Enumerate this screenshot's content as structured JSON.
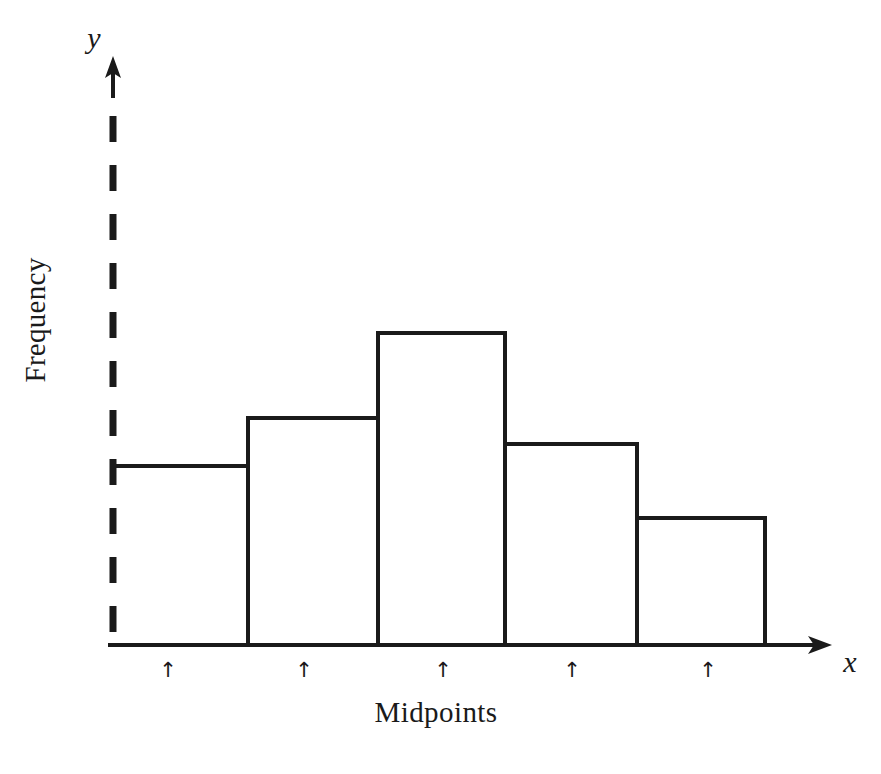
{
  "figure": {
    "background_color": "#ffffff",
    "ink_color": "#1a1a1a",
    "width": 881,
    "height": 774
  },
  "labels": {
    "y_axis_symbol": "y",
    "x_axis_symbol": "x",
    "y_axis_title": "Frequency",
    "x_axis_caption": "Midpoints",
    "tick_marker_glyph": "↑"
  },
  "chart_data": {
    "type": "bar",
    "title": "",
    "subtitle": "",
    "xlabel": "Midpoints",
    "ylabel": "Frequency",
    "grid": false,
    "legend": "none",
    "axis_style": {
      "y_axis_line": "dashed",
      "x_axis_line": "solid",
      "y_axis_arrow": true,
      "x_axis_arrow": true,
      "tick_labels_shown": false,
      "tick_markers": "up-arrow"
    },
    "categories": [
      "Midpoint 1",
      "Midpoint 2",
      "Midpoint 3",
      "Midpoint 4",
      "Midpoint 5"
    ],
    "values": [
      3.2,
      4.3,
      6.3,
      3.8,
      2.3
    ],
    "values_note": "relative bar heights read from baseline in pixels: 179, 227, 312, 201, 127",
    "ylim": [
      0,
      8
    ],
    "xlim": [
      0,
      5
    ],
    "bars": [
      {
        "index": 0,
        "label": "Midpoint 1",
        "value": 3.2,
        "pixel_left": 113,
        "pixel_right": 248,
        "pixel_top": 466,
        "left_edge_drawn": false,
        "midpoint_tick_x": 168
      },
      {
        "index": 1,
        "label": "Midpoint 2",
        "value": 4.3,
        "pixel_left": 248,
        "pixel_right": 378,
        "pixel_top": 418,
        "left_edge_drawn": true,
        "midpoint_tick_x": 304
      },
      {
        "index": 2,
        "label": "Midpoint 3",
        "value": 6.3,
        "pixel_left": 378,
        "pixel_right": 505,
        "pixel_top": 333,
        "left_edge_drawn": true,
        "midpoint_tick_x": 443
      },
      {
        "index": 3,
        "label": "Midpoint 4",
        "value": 3.8,
        "pixel_left": 505,
        "pixel_right": 637,
        "pixel_top": 444,
        "left_edge_drawn": true,
        "midpoint_tick_x": 572
      },
      {
        "index": 4,
        "label": "Midpoint 5",
        "value": 2.3,
        "pixel_left": 637,
        "pixel_right": 765,
        "pixel_top": 518,
        "left_edge_drawn": true,
        "midpoint_tick_x": 708
      }
    ],
    "baseline_pixel_y": 645,
    "y_axis_pixel_x": 113
  }
}
